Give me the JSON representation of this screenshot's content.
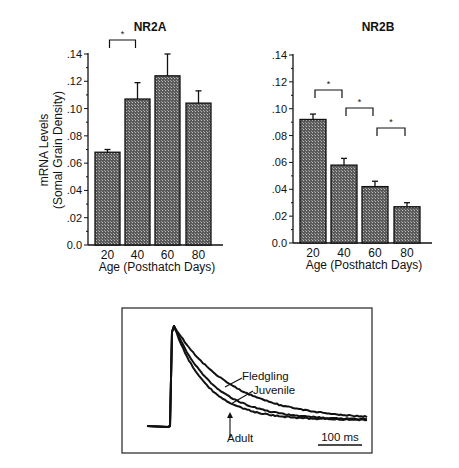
{
  "chart_data": [
    {
      "type": "bar",
      "title": "NR2A",
      "xlabel": "Age (Posthatch Days)",
      "ylabel": "mRNA Levels (Somal Grain Density)",
      "ylabel_lines": [
        "mRNA Levels",
        "(Somal Grain Density)"
      ],
      "categories": [
        "20",
        "40",
        "60",
        "80"
      ],
      "values": [
        0.068,
        0.107,
        0.124,
        0.104
      ],
      "errors": [
        0.002,
        0.012,
        0.016,
        0.009
      ],
      "ylim": [
        0,
        0.14
      ],
      "yticks": [
        ".14",
        ".12",
        ".10",
        ".08",
        ".06",
        ".04",
        ".02",
        "0.0"
      ],
      "significance": [
        {
          "from": "20",
          "to": "40",
          "label": "*"
        }
      ],
      "grid": false
    },
    {
      "type": "bar",
      "title": "NR2B",
      "xlabel": "Age (Posthatch Days)",
      "ylabel": "",
      "categories": [
        "20",
        "40",
        "60",
        "80"
      ],
      "values": [
        0.092,
        0.058,
        0.042,
        0.027
      ],
      "errors": [
        0.004,
        0.005,
        0.004,
        0.003
      ],
      "ylim": [
        0,
        0.14
      ],
      "yticks": [
        ".14",
        ".12",
        ".10",
        ".08",
        ".06",
        ".04",
        ".02",
        "0.0"
      ],
      "significance": [
        {
          "from": "20",
          "to": "40",
          "label": "*"
        },
        {
          "from": "40",
          "to": "60",
          "label": "*"
        },
        {
          "from": "60",
          "to": "80",
          "label": "*"
        }
      ],
      "grid": false
    },
    {
      "type": "line",
      "title": "",
      "series": [
        {
          "name": "Fledgling",
          "decay": "slowest"
        },
        {
          "name": "Juvenile",
          "decay": "intermediate"
        },
        {
          "name": "Adult",
          "decay": "fastest"
        }
      ],
      "scale_bar": "100 ms",
      "annotations": [
        "Fledgling",
        "Juvenile",
        "Adult"
      ]
    }
  ],
  "panels": {
    "nr2a": {
      "title": "NR2A",
      "xlabel": "Age (Posthatch Days)",
      "ylabel1": "mRNA Levels",
      "ylabel2": "(Somal Grain Density)"
    },
    "nr2b": {
      "title": "NR2B",
      "xlabel": "Age (Posthatch Days)"
    },
    "trace": {
      "fledgling": "Fledgling",
      "juvenile": "Juvenile",
      "adult": "Adult",
      "scale": "100 ms"
    }
  }
}
